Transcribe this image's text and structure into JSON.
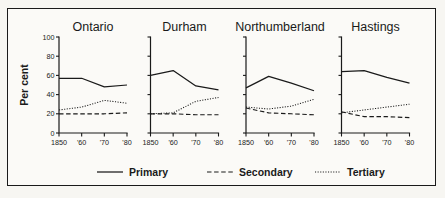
{
  "chart_data": {
    "type": "line",
    "title": "",
    "xlabel": "",
    "ylabel": "Per cent",
    "ylim": [
      0,
      100
    ],
    "yticks": [
      0,
      20,
      40,
      60,
      80,
      100
    ],
    "ytick_labels": [
      "0",
      "20",
      "40",
      "60",
      "80",
      "100"
    ],
    "x": [
      1850,
      1860,
      1870,
      1880
    ],
    "xtick_labels": [
      "1850",
      "'60",
      "'70",
      "'80"
    ],
    "grid": false,
    "legend_position": "bottom-center",
    "legend": [
      "Primary",
      "Secondary",
      "Tertiary"
    ],
    "panels": [
      {
        "title": "Ontario",
        "series": [
          {
            "name": "Primary",
            "values": [
              57,
              57,
              48,
              50
            ]
          },
          {
            "name": "Secondary",
            "values": [
              20,
              20,
              20,
              21
            ]
          },
          {
            "name": "Tertiary",
            "values": [
              24,
              27,
              34,
              31
            ]
          }
        ]
      },
      {
        "title": "Durham",
        "series": [
          {
            "name": "Primary",
            "values": [
              60,
              65,
              49,
              45
            ]
          },
          {
            "name": "Secondary",
            "values": [
              20,
              20,
              19,
              19
            ]
          },
          {
            "name": "Tertiary",
            "values": [
              20,
              21,
              33,
              37
            ]
          }
        ]
      },
      {
        "title": "Northumberland",
        "series": [
          {
            "name": "Primary",
            "values": [
              47,
              59,
              52,
              44
            ]
          },
          {
            "name": "Secondary",
            "values": [
              26,
              21,
              20,
              19
            ]
          },
          {
            "name": "Tertiary",
            "values": [
              27,
              25,
              28,
              35
            ]
          }
        ]
      },
      {
        "title": "Hastings",
        "series": [
          {
            "name": "Primary",
            "values": [
              64,
              65,
              58,
              52
            ]
          },
          {
            "name": "Secondary",
            "values": [
              22,
              17,
              17,
              16
            ]
          },
          {
            "name": "Tertiary",
            "values": [
              21,
              24,
              27,
              30
            ]
          }
        ]
      }
    ]
  },
  "axis": {
    "ylabel": "Per cent"
  },
  "legend": {
    "items": [
      {
        "label": "Primary",
        "style": "solid"
      },
      {
        "label": "Secondary",
        "style": "dashed"
      },
      {
        "label": "Tertiary",
        "style": "dotted"
      }
    ]
  },
  "colors": {
    "ink": "#1a1a1a",
    "paper": "#fbfaf7",
    "surround": "#f7f6f2"
  }
}
